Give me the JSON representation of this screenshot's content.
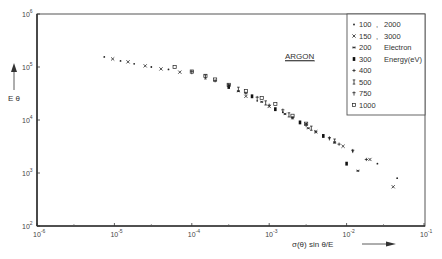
{
  "chart_data": {
    "type": "scatter",
    "title": "",
    "annotation": "ARGON",
    "xlabel": "σ(θ) sin θ/E",
    "ylabel": "E θ",
    "xscale": "log",
    "yscale": "log",
    "xlim": [
      1e-06,
      0.1
    ],
    "ylim": [
      100.0,
      1000000.0
    ],
    "x_ticks": [
      "10^-6",
      "10^-5",
      "10^-4",
      "10^-3",
      "10^-2",
      "10^-1"
    ],
    "y_ticks": [
      "10^2",
      "10^3",
      "10^4",
      "10^5",
      "10^6"
    ],
    "grid": false,
    "legend_position": "upper right",
    "legend_note": "Electron Energy(eV)",
    "series": [
      {
        "name": "100",
        "marker": "dot",
        "points": [
          [
            0.0007,
            23000.0
          ],
          [
            0.0015,
            14000.0
          ],
          [
            0.003,
            8500.0
          ],
          [
            0.006,
            4500.0
          ],
          [
            0.012,
            2600.0
          ],
          [
            0.025,
            1500.0
          ],
          [
            0.045,
            800.0
          ]
        ]
      },
      {
        "name": "150",
        "marker": "x",
        "points": [
          [
            0.0005,
            28000.0
          ],
          [
            0.001,
            18000.0
          ],
          [
            0.002,
            11000.0
          ],
          [
            0.004,
            6000.0
          ],
          [
            0.009,
            3200.0
          ],
          [
            0.02,
            1800.0
          ],
          [
            0.04,
            550.0
          ]
        ]
      },
      {
        "name": "200",
        "marker": "star",
        "points": [
          [
            0.0004,
            35000.0
          ],
          [
            0.0008,
            22000.0
          ],
          [
            0.0016,
            13000.0
          ],
          [
            0.0032,
            7000.0
          ],
          [
            0.007,
            3800.0
          ],
          [
            0.014,
            1100.0
          ]
        ]
      },
      {
        "name": "300",
        "marker": "filled-square",
        "points": [
          [
            0.0003,
            42000.0
          ],
          [
            0.0006,
            28000.0
          ],
          [
            0.0012,
            16000.0
          ],
          [
            0.0025,
            9000.0
          ],
          [
            0.005,
            5000.0
          ],
          [
            0.01,
            1500.0
          ]
        ]
      },
      {
        "name": "400",
        "marker": "plus",
        "points": [
          [
            0.0002,
            55000.0
          ],
          [
            0.0005,
            32000.0
          ],
          [
            0.001,
            19000.0
          ],
          [
            0.002,
            11000.0
          ],
          [
            0.004,
            6000.0
          ],
          [
            0.008,
            3500.0
          ],
          [
            0.018,
            1800.0
          ]
        ]
      },
      {
        "name": "500",
        "marker": "bar",
        "points": [
          [
            0.00015,
            65000.0
          ],
          [
            0.0004,
            38000.0
          ],
          [
            0.0009,
            21000.0
          ],
          [
            0.0018,
            12500.0
          ],
          [
            0.0035,
            7000.0
          ],
          [
            0.007,
            4000.0
          ]
        ]
      },
      {
        "name": "750",
        "marker": "cross-bar",
        "points": [
          [
            0.0001,
            80000.0
          ],
          [
            0.0003,
            45000.0
          ],
          [
            0.0007,
            26000.0
          ],
          [
            0.0015,
            15000.0
          ],
          [
            0.003,
            8000.0
          ],
          [
            0.006,
            4500.0
          ],
          [
            0.012,
            2600.0
          ]
        ]
      },
      {
        "name": "1000",
        "marker": "open-square",
        "points": [
          [
            6e-05,
            100000.0
          ],
          [
            0.0001,
            82000.0
          ],
          [
            0.00015,
            68000.0
          ],
          [
            0.0002,
            58000.0
          ],
          [
            0.0003,
            46000.0
          ],
          [
            0.0005,
            35000.0
          ],
          [
            0.0008,
            26000.0
          ],
          [
            0.0012,
            20000.0
          ],
          [
            0.002,
            12000.0
          ],
          [
            0.003,
            8500.0
          ]
        ]
      },
      {
        "name": "2000",
        "marker": "dot",
        "points": [
          [
            7.4e-06,
            155000.0
          ],
          [
            1.2e-05,
            130000.0
          ],
          [
            1.8e-05,
            115000.0
          ],
          [
            3e-05,
            100000.0
          ],
          [
            5e-05,
            90000.0
          ]
        ]
      },
      {
        "name": "3000",
        "marker": "x",
        "points": [
          [
            9.5e-06,
            142000.0
          ],
          [
            1.5e-05,
            125000.0
          ],
          [
            2.5e-05,
            105000.0
          ],
          [
            4e-05,
            92000.0
          ],
          [
            7e-05,
            80000.0
          ]
        ]
      }
    ],
    "legend": [
      {
        "marker": "dot",
        "label_left": "100",
        "label_right": "2000"
      },
      {
        "marker": "x",
        "label_left": "150",
        "label_right": "3000"
      },
      {
        "marker": "star",
        "label_left": "200",
        "label_right": "Electron"
      },
      {
        "marker": "filled-square",
        "label_left": "300",
        "label_right": "Energy(eV)"
      },
      {
        "marker": "plus",
        "label_left": "400",
        "label_right": ""
      },
      {
        "marker": "bar",
        "label_left": "500",
        "label_right": ""
      },
      {
        "marker": "cross-bar",
        "label_left": "750",
        "label_right": ""
      },
      {
        "marker": "open-square",
        "label_left": "1000",
        "label_right": ""
      }
    ]
  }
}
